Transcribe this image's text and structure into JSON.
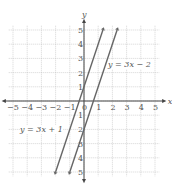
{
  "chart_data": {
    "type": "line",
    "title": "",
    "xlabel": "x",
    "ylabel": "y",
    "xlim": [
      -5,
      5
    ],
    "ylim": [
      -5,
      5
    ],
    "grid": true,
    "x_ticks": [
      -5,
      -4,
      -3,
      -2,
      -1,
      0,
      1,
      2,
      3,
      4,
      5
    ],
    "y_ticks": [
      -5,
      -4,
      -3,
      -2,
      -1,
      1,
      2,
      3,
      4,
      5
    ],
    "series": [
      {
        "name": "y = 3x + 1",
        "slope": 3,
        "intercept": 1,
        "x": [
          -2,
          1.33
        ],
        "y": [
          -5,
          5
        ]
      },
      {
        "name": "y = 3x − 2",
        "slope": 3,
        "intercept": -2,
        "x": [
          -1,
          2.33
        ],
        "y": [
          -5,
          5
        ]
      }
    ],
    "annotations": [
      "y = 3x − 2",
      "y = 3x + 1"
    ]
  },
  "labels": {
    "line1": "y = 3x − 2",
    "line2": "y = 3x + 1",
    "x_axis": "x",
    "y_axis": "y"
  }
}
